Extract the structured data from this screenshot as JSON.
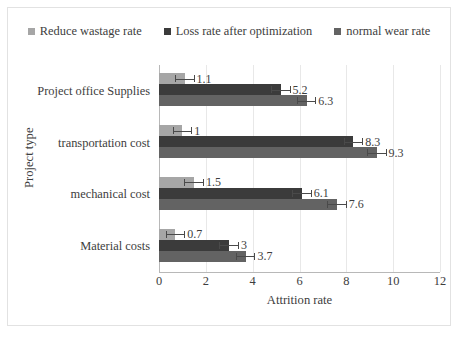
{
  "chart_data": {
    "type": "bar",
    "orientation": "horizontal",
    "title": "",
    "xlabel": "Attrition rate",
    "ylabel": "Project type",
    "categories": [
      "Project office Supplies",
      "transportation cost",
      "mechanical cost",
      "Material costs"
    ],
    "series": [
      {
        "name": "Reduce wastage rate",
        "color": "#a6a6a6",
        "values": [
          1.1,
          1,
          1.5,
          0.7
        ],
        "labels": [
          "1.1",
          "1",
          "1.5",
          "0.7"
        ]
      },
      {
        "name": "Loss rate after optimization",
        "color": "#3b3b3b",
        "values": [
          5.2,
          8.3,
          6.1,
          3
        ],
        "labels": [
          "5.2",
          "8.3",
          "6.1",
          "3"
        ]
      },
      {
        "name": "normal wear rate",
        "color": "#636363",
        "values": [
          6.3,
          9.3,
          7.6,
          3.7
        ],
        "labels": [
          "6.3",
          "9.3",
          "7.6",
          "3.7"
        ]
      }
    ],
    "xlim": [
      0,
      12
    ],
    "xticks": [
      "0",
      "2",
      "4",
      "6",
      "8",
      "10",
      "12"
    ],
    "xtick_values": [
      0,
      2,
      4,
      6,
      8,
      10,
      12
    ],
    "grid": "vertical",
    "legend_position": "top",
    "error_bars": true,
    "error_half_width": 0.42
  },
  "legend": {
    "items": [
      {
        "label": "Reduce wastage rate",
        "color": "#a6a6a6",
        "marker": "square-marker"
      },
      {
        "label": "Loss rate after optimization",
        "color": "#3b3b3b",
        "marker": "square-marker"
      },
      {
        "label": "normal wear rate",
        "color": "#636363",
        "marker": "square-marker"
      }
    ]
  },
  "axes": {
    "y_title": "Project type",
    "x_title": "Attrition rate"
  }
}
